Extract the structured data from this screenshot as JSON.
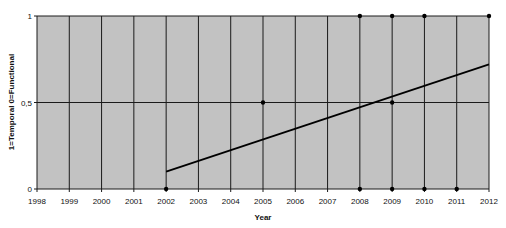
{
  "chart_data": {
    "type": "scatter",
    "title": "",
    "xlabel": "Year",
    "ylabel": "1=Temporal 0=Functional",
    "xlim": [
      1998,
      2012
    ],
    "ylim": [
      0,
      1
    ],
    "x_ticks": [
      "1998",
      "1999",
      "2000",
      "2001",
      "2002",
      "2003",
      "2004",
      "2005",
      "2006",
      "2007",
      "2008",
      "2009",
      "2010",
      "2011",
      "2012"
    ],
    "y_ticks": [
      "0",
      "0,5",
      "1"
    ],
    "grid": true,
    "background_color": "#c2c2c2",
    "series": [
      {
        "name": "observations",
        "kind": "points",
        "points": [
          {
            "x": 2002,
            "y": 0
          },
          {
            "x": 2005,
            "y": 0.5
          },
          {
            "x": 2008,
            "y": 1
          },
          {
            "x": 2008,
            "y": 0
          },
          {
            "x": 2009,
            "y": 1
          },
          {
            "x": 2009,
            "y": 0.5
          },
          {
            "x": 2009,
            "y": 0
          },
          {
            "x": 2010,
            "y": 1
          },
          {
            "x": 2010,
            "y": 0
          },
          {
            "x": 2011,
            "y": 0
          },
          {
            "x": 2012,
            "y": 1
          }
        ]
      },
      {
        "name": "trend",
        "kind": "line",
        "points": [
          {
            "x": 2002,
            "y": 0.1
          },
          {
            "x": 2012,
            "y": 0.72
          }
        ]
      }
    ]
  }
}
